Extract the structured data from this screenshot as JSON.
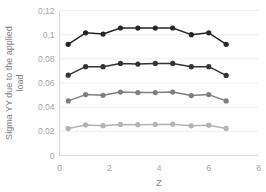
{
  "chart_data": {
    "type": "line",
    "title": "",
    "xlabel": "Z",
    "ylabel": "Sigma YY due to the applied load",
    "ylabel_line1": "Sigma YY due to the applied",
    "ylabel_line2": "load",
    "xlim": [
      0,
      8
    ],
    "ylim": [
      0,
      0.12
    ],
    "grid": true,
    "legend": "none",
    "decimal_separator": ",",
    "xticks": [
      0,
      2,
      4,
      6,
      8
    ],
    "xtick_labels": [
      "0",
      "2",
      "4",
      "6",
      "8"
    ],
    "yticks": [
      0,
      0.02,
      0.04,
      0.06,
      0.08,
      0.1,
      0.12
    ],
    "ytick_labels": [
      "0",
      "0,02",
      "0,04",
      "0,06",
      "0,08",
      "0,1",
      "0,12"
    ],
    "x": [
      0.35,
      1.05,
      1.75,
      2.45,
      3.15,
      3.85,
      4.55,
      5.3,
      6.0,
      6.7
    ],
    "series": [
      {
        "name": "series-1",
        "color": "#262626",
        "values": [
          0.092,
          0.1015,
          0.1005,
          0.1055,
          0.1055,
          0.1055,
          0.1055,
          0.1,
          0.1015,
          0.092
        ]
      },
      {
        "name": "series-2",
        "color": "#333333",
        "values": [
          0.0665,
          0.0735,
          0.0735,
          0.0762,
          0.0757,
          0.0762,
          0.0762,
          0.0735,
          0.0735,
          0.0663
        ]
      },
      {
        "name": "series-3",
        "color": "#7f7f7f",
        "values": [
          0.0452,
          0.0504,
          0.0498,
          0.0525,
          0.0521,
          0.0521,
          0.0525,
          0.0496,
          0.0504,
          0.0452
        ]
      },
      {
        "name": "series-4",
        "color": "#b3b3b3",
        "values": [
          0.0223,
          0.0253,
          0.0247,
          0.0257,
          0.0255,
          0.0257,
          0.0259,
          0.0246,
          0.0251,
          0.0224
        ]
      }
    ]
  },
  "style": {
    "axis_color": "#d9d9d9",
    "grid_color": "#f0f0f0",
    "tick_text_color": "#a6a6a6",
    "title_text_color": "#7f7f7f",
    "background": "#ffffff"
  }
}
